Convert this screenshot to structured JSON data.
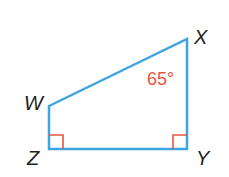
{
  "figure": {
    "type": "quadrilateral",
    "vertices": [
      {
        "name": "W",
        "x": 49,
        "y": 106,
        "label_x": 24,
        "label_y": 110
      },
      {
        "name": "X",
        "x": 187,
        "y": 39,
        "label_x": 194,
        "label_y": 44
      },
      {
        "name": "Y",
        "x": 187,
        "y": 149,
        "label_x": 196,
        "label_y": 164
      },
      {
        "name": "Z",
        "x": 49,
        "y": 149,
        "label_x": 27,
        "label_y": 164
      }
    ],
    "angle_label": {
      "text": "65°",
      "vertex": "X"
    },
    "right_angles": [
      "Z",
      "Y"
    ],
    "colors": {
      "edge": "#3fa5e0",
      "marks": "#e8553e",
      "labels": "#231f20"
    }
  }
}
